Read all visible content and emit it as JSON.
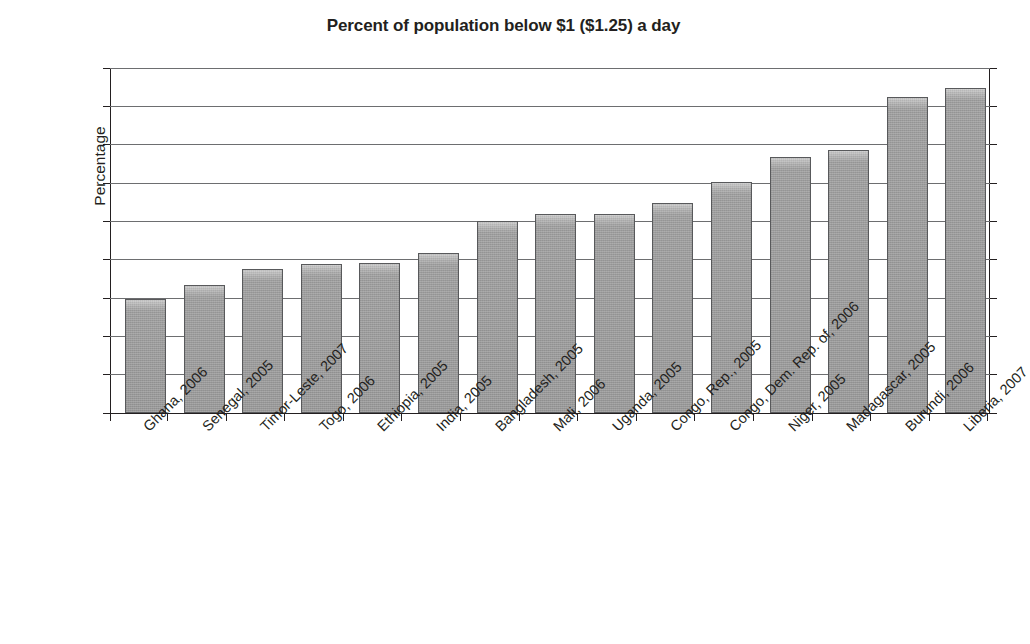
{
  "chart_data": {
    "type": "bar",
    "title": "Percent of population below $1 ($1.25) a day",
    "xlabel": "",
    "ylabel": "Percentage",
    "ylim": [
      0,
      90
    ],
    "yticks": [
      0,
      10,
      20,
      30,
      40,
      50,
      60,
      70,
      80,
      90
    ],
    "grid": true,
    "legend": false,
    "categories": [
      "Ghana, 2006",
      "Senegal, 2005",
      "Timor-Leste, 2007",
      "Togo, 2006",
      "Ethiopia, 2005",
      "India, 2005",
      "Bangladesh, 2005",
      "Mali, 2006",
      "Uganda, 2005",
      "Congo, Rep., 2005",
      "Congo, Dem. Rep. of, 2006",
      "Niger, 2005",
      "Madagascar, 2005",
      "Burundi, 2006",
      "Liberia, 2007"
    ],
    "values": [
      29.7,
      33.5,
      37.5,
      39.0,
      39.2,
      41.8,
      50.0,
      51.9,
      51.9,
      54.9,
      60.3,
      66.9,
      68.7,
      82.4,
      84.8
    ],
    "bar_color": "#9a9a9a",
    "bar_edge_color": "#58595b",
    "grid_color": "#6d6e70",
    "axis_color": "#231f20"
  }
}
